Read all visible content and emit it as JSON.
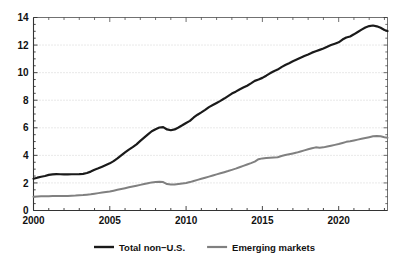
{
  "chart_data": {
    "type": "line",
    "title": "",
    "subtitle": "",
    "xlabel": "",
    "ylabel": "",
    "xlim": [
      2000,
      2023.2
    ],
    "ylim": [
      0,
      14
    ],
    "yticks": [
      0,
      2,
      4,
      6,
      8,
      10,
      12,
      14
    ],
    "ytick_labels": [
      "0",
      "2",
      "4",
      "6",
      "8",
      "10",
      "12",
      "14"
    ],
    "xticks": [
      2000,
      2005,
      2010,
      2015,
      2020
    ],
    "xtick_labels": [
      "2000",
      "2005",
      "2010",
      "2015",
      "2020"
    ],
    "xminor_step": 1,
    "yminor_step": 0.5,
    "grid": {
      "horizontal": true,
      "vertical": false,
      "style": "dotted",
      "color": "#c8c8c8"
    },
    "legend": {
      "position": "bottom-center",
      "entries": [
        {
          "name": "Total non-U.S.",
          "label": "Total non−U.S.",
          "color": "#1a1a1a"
        },
        {
          "name": "Emerging markets",
          "label": "Emerging markets",
          "color": "#808080"
        }
      ]
    },
    "series": [
      {
        "name": "Total non-U.S.",
        "label": "Total non−U.S.",
        "color": "#1a1a1a",
        "width": 2.2,
        "x": [
          2000.0,
          2000.25,
          2000.5,
          2000.75,
          2001.0,
          2001.25,
          2001.5,
          2001.75,
          2002.0,
          2002.25,
          2002.5,
          2002.75,
          2003.0,
          2003.25,
          2003.5,
          2003.75,
          2004.0,
          2004.25,
          2004.5,
          2004.75,
          2005.0,
          2005.25,
          2005.5,
          2005.75,
          2006.0,
          2006.25,
          2006.5,
          2006.75,
          2007.0,
          2007.25,
          2007.5,
          2007.75,
          2008.0,
          2008.25,
          2008.5,
          2008.75,
          2009.0,
          2009.25,
          2009.5,
          2009.75,
          2010.0,
          2010.25,
          2010.5,
          2010.75,
          2011.0,
          2011.25,
          2011.5,
          2011.75,
          2012.0,
          2012.25,
          2012.5,
          2012.75,
          2013.0,
          2013.25,
          2013.5,
          2013.75,
          2014.0,
          2014.25,
          2014.5,
          2014.75,
          2015.0,
          2015.25,
          2015.5,
          2015.75,
          2016.0,
          2016.25,
          2016.5,
          2016.75,
          2017.0,
          2017.25,
          2017.5,
          2017.75,
          2018.0,
          2018.25,
          2018.5,
          2018.75,
          2019.0,
          2019.25,
          2019.5,
          2019.75,
          2020.0,
          2020.25,
          2020.5,
          2020.75,
          2021.0,
          2021.25,
          2021.5,
          2021.75,
          2022.0,
          2022.25,
          2022.5,
          2022.75,
          2023.0,
          2023.2
        ],
        "values": [
          2.3,
          2.38,
          2.45,
          2.5,
          2.58,
          2.62,
          2.64,
          2.63,
          2.62,
          2.62,
          2.63,
          2.63,
          2.64,
          2.66,
          2.72,
          2.82,
          2.95,
          3.06,
          3.18,
          3.3,
          3.42,
          3.58,
          3.78,
          4.0,
          4.22,
          4.42,
          4.6,
          4.8,
          5.05,
          5.28,
          5.52,
          5.75,
          5.9,
          6.02,
          6.05,
          5.88,
          5.82,
          5.88,
          6.02,
          6.18,
          6.35,
          6.5,
          6.75,
          6.95,
          7.12,
          7.3,
          7.5,
          7.65,
          7.8,
          7.95,
          8.12,
          8.3,
          8.48,
          8.62,
          8.78,
          8.92,
          9.05,
          9.22,
          9.4,
          9.5,
          9.62,
          9.78,
          9.95,
          10.1,
          10.22,
          10.4,
          10.55,
          10.68,
          10.82,
          10.95,
          11.08,
          11.2,
          11.32,
          11.45,
          11.55,
          11.65,
          11.75,
          11.88,
          12.0,
          12.1,
          12.2,
          12.4,
          12.55,
          12.62,
          12.78,
          12.95,
          13.12,
          13.28,
          13.38,
          13.42,
          13.36,
          13.25,
          13.1,
          13.02
        ]
      },
      {
        "name": "Emerging markets",
        "label": "Emerging markets",
        "color": "#808080",
        "width": 2.0,
        "x": [
          2000.0,
          2000.25,
          2000.5,
          2000.75,
          2001.0,
          2001.25,
          2001.5,
          2001.75,
          2002.0,
          2002.25,
          2002.5,
          2002.75,
          2003.0,
          2003.25,
          2003.5,
          2003.75,
          2004.0,
          2004.25,
          2004.5,
          2004.75,
          2005.0,
          2005.25,
          2005.5,
          2005.75,
          2006.0,
          2006.25,
          2006.5,
          2006.75,
          2007.0,
          2007.25,
          2007.5,
          2007.75,
          2008.0,
          2008.25,
          2008.5,
          2008.75,
          2009.0,
          2009.25,
          2009.5,
          2009.75,
          2010.0,
          2010.25,
          2010.5,
          2010.75,
          2011.0,
          2011.25,
          2011.5,
          2011.75,
          2012.0,
          2012.25,
          2012.5,
          2012.75,
          2013.0,
          2013.25,
          2013.5,
          2013.75,
          2014.0,
          2014.25,
          2014.5,
          2014.75,
          2015.0,
          2015.25,
          2015.5,
          2015.75,
          2016.0,
          2016.25,
          2016.5,
          2016.75,
          2017.0,
          2017.25,
          2017.5,
          2017.75,
          2018.0,
          2018.25,
          2018.5,
          2018.75,
          2019.0,
          2019.25,
          2019.5,
          2019.75,
          2020.0,
          2020.25,
          2020.5,
          2020.75,
          2021.0,
          2021.25,
          2021.5,
          2021.75,
          2022.0,
          2022.25,
          2022.5,
          2022.75,
          2023.0,
          2023.2
        ],
        "values": [
          1.0,
          1.02,
          1.03,
          1.03,
          1.04,
          1.05,
          1.05,
          1.05,
          1.05,
          1.06,
          1.07,
          1.08,
          1.1,
          1.12,
          1.15,
          1.18,
          1.22,
          1.26,
          1.3,
          1.34,
          1.38,
          1.44,
          1.5,
          1.56,
          1.62,
          1.68,
          1.74,
          1.8,
          1.86,
          1.92,
          1.98,
          2.04,
          2.06,
          2.08,
          2.06,
          1.92,
          1.88,
          1.88,
          1.92,
          1.96,
          2.0,
          2.06,
          2.14,
          2.22,
          2.3,
          2.38,
          2.46,
          2.54,
          2.62,
          2.7,
          2.78,
          2.86,
          2.95,
          3.04,
          3.14,
          3.24,
          3.34,
          3.44,
          3.55,
          3.72,
          3.78,
          3.8,
          3.82,
          3.84,
          3.86,
          3.95,
          4.02,
          4.08,
          4.14,
          4.2,
          4.28,
          4.36,
          4.44,
          4.52,
          4.58,
          4.56,
          4.58,
          4.64,
          4.7,
          4.76,
          4.82,
          4.9,
          4.98,
          5.02,
          5.08,
          5.14,
          5.2,
          5.26,
          5.32,
          5.38,
          5.4,
          5.38,
          5.32,
          5.28
        ]
      }
    ]
  },
  "axes": {
    "y_tick_labels": [
      "14",
      "12",
      "10",
      "8",
      "6",
      "4",
      "2",
      "0"
    ],
    "x_tick_labels": [
      "2000",
      "2005",
      "2010",
      "2015",
      "2020"
    ]
  },
  "legend": {
    "items": [
      {
        "label": "Total non−U.S.",
        "color": "#1a1a1a"
      },
      {
        "label": "Emerging markets",
        "color": "#808080"
      }
    ]
  },
  "colors": {
    "background": "#ffffff",
    "axis": "#333333",
    "grid": "#c8c8c8",
    "series_primary": "#1a1a1a",
    "series_secondary": "#808080",
    "text": "#111111"
  }
}
